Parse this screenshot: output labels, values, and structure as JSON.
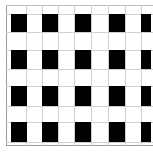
{
  "pattern": {
    "type": "checkerboard-grid",
    "colors": {
      "background": "#ffffff",
      "cell": "#000000",
      "gridline": "#cfcfcf",
      "border": "#9a9a9a"
    },
    "column_lines_x": [
      26,
      42,
      58,
      74,
      91,
      108,
      125,
      141
    ],
    "row_lines_y": [
      14,
      32,
      50,
      69,
      86,
      106,
      122,
      142
    ],
    "black_cells": [
      {
        "x": 11,
        "y": 14,
        "w": 16,
        "h": 18
      },
      {
        "x": 42,
        "y": 14,
        "w": 16,
        "h": 18
      },
      {
        "x": 75,
        "y": 14,
        "w": 16,
        "h": 18
      },
      {
        "x": 109,
        "y": 14,
        "w": 16,
        "h": 18
      },
      {
        "x": 141,
        "y": 14,
        "w": 10,
        "h": 18
      },
      {
        "x": 11,
        "y": 50,
        "w": 16,
        "h": 19
      },
      {
        "x": 42,
        "y": 50,
        "w": 16,
        "h": 19
      },
      {
        "x": 75,
        "y": 50,
        "w": 16,
        "h": 19
      },
      {
        "x": 109,
        "y": 50,
        "w": 16,
        "h": 19
      },
      {
        "x": 141,
        "y": 50,
        "w": 10,
        "h": 19
      },
      {
        "x": 11,
        "y": 86,
        "w": 16,
        "h": 20
      },
      {
        "x": 42,
        "y": 86,
        "w": 16,
        "h": 20
      },
      {
        "x": 75,
        "y": 86,
        "w": 16,
        "h": 20
      },
      {
        "x": 109,
        "y": 86,
        "w": 16,
        "h": 20
      },
      {
        "x": 141,
        "y": 86,
        "w": 10,
        "h": 20
      },
      {
        "x": 11,
        "y": 122,
        "w": 16,
        "h": 20
      },
      {
        "x": 42,
        "y": 122,
        "w": 16,
        "h": 20
      },
      {
        "x": 75,
        "y": 122,
        "w": 16,
        "h": 20
      },
      {
        "x": 109,
        "y": 122,
        "w": 16,
        "h": 20
      },
      {
        "x": 141,
        "y": 122,
        "w": 10,
        "h": 20
      }
    ]
  }
}
